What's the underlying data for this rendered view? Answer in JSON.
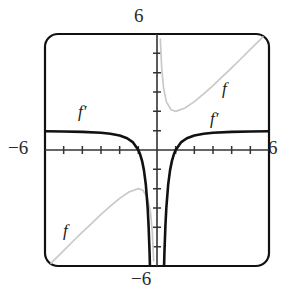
{
  "figure": {
    "title": "",
    "axis_labels": {
      "top": "6",
      "left": "−6",
      "right": "6",
      "bottom": "−6"
    },
    "curve_labels": {
      "f_upper": "f",
      "f_lower": "f",
      "fprime_left": "f′",
      "fprime_right": "f′"
    },
    "colors": {
      "f_curve": "#c9c9c9",
      "fprime_curve": "#111111",
      "axis": "#333333",
      "frame": "#111111",
      "background": "#ffffff"
    }
  },
  "chart_data": {
    "type": "line",
    "title": "",
    "xlabel": "",
    "ylabel": "",
    "xlim": [
      -6,
      6
    ],
    "ylim": [
      -6,
      6
    ],
    "grid": false,
    "legend": "inline-curve-labels",
    "xticks": [
      -5,
      -4,
      -3,
      -2,
      -1,
      1,
      2,
      3,
      4,
      5
    ],
    "yticks": [
      -5,
      -4,
      -3,
      -2,
      -1,
      1,
      2,
      3,
      4,
      5
    ],
    "xtick_labels": [
      "−6",
      "6"
    ],
    "ytick_labels": [
      "−6",
      "6"
    ],
    "annotations": [
      {
        "text": "f",
        "x": 4.0,
        "y": 3.1
      },
      {
        "text": "f",
        "x": -3.5,
        "y": -2.55
      },
      {
        "text": "f′",
        "x": -2.7,
        "y": 1.8
      },
      {
        "text": "f′",
        "x": 3.2,
        "y": 1.45
      }
    ],
    "series": [
      {
        "name": "f",
        "expression": "f(x) = x + 1/x",
        "color": "#c9c9c9",
        "style": "solid-light",
        "asymptotes": {
          "vertical": [
            0
          ],
          "oblique": [
            "y = x"
          ]
        },
        "local_max": {
          "x": -1,
          "y": -2
        },
        "local_min": {
          "x": 1,
          "y": 2
        },
        "branch_negative_x": [
          {
            "x": -6.0,
            "y": -6.17
          },
          {
            "x": -5.5,
            "y": -5.68
          },
          {
            "x": -5.0,
            "y": -5.2
          },
          {
            "x": -4.5,
            "y": -4.72
          },
          {
            "x": -4.0,
            "y": -4.25
          },
          {
            "x": -3.5,
            "y": -3.79
          },
          {
            "x": -3.0,
            "y": -3.33
          },
          {
            "x": -2.5,
            "y": -2.9
          },
          {
            "x": -2.0,
            "y": -2.5
          },
          {
            "x": -1.5,
            "y": -2.17
          },
          {
            "x": -1.0,
            "y": -2.0
          },
          {
            "x": -0.75,
            "y": -2.08
          },
          {
            "x": -0.5,
            "y": -2.5
          },
          {
            "x": -0.35,
            "y": -3.21
          },
          {
            "x": -0.25,
            "y": -4.25
          },
          {
            "x": -0.18,
            "y": -5.74
          }
        ],
        "branch_positive_x": [
          {
            "x": 0.18,
            "y": 5.74
          },
          {
            "x": 0.25,
            "y": 4.25
          },
          {
            "x": 0.35,
            "y": 3.21
          },
          {
            "x": 0.5,
            "y": 2.5
          },
          {
            "x": 0.75,
            "y": 2.08
          },
          {
            "x": 1.0,
            "y": 2.0
          },
          {
            "x": 1.5,
            "y": 2.17
          },
          {
            "x": 2.0,
            "y": 2.5
          },
          {
            "x": 2.5,
            "y": 2.9
          },
          {
            "x": 3.0,
            "y": 3.33
          },
          {
            "x": 3.5,
            "y": 3.79
          },
          {
            "x": 4.0,
            "y": 4.25
          },
          {
            "x": 4.5,
            "y": 4.72
          },
          {
            "x": 5.0,
            "y": 5.2
          },
          {
            "x": 5.5,
            "y": 5.68
          },
          {
            "x": 6.0,
            "y": 6.17
          }
        ]
      },
      {
        "name": "f'",
        "expression": "f′(x) = 1 − 1/x²",
        "color": "#111111",
        "style": "solid-bold",
        "asymptotes": {
          "vertical": [
            0
          ],
          "horizontal": [
            "y = 1"
          ]
        },
        "zeros": [
          -1,
          1
        ],
        "branch_negative_x": [
          {
            "x": -6.0,
            "y": 0.972
          },
          {
            "x": -5.0,
            "y": 0.96
          },
          {
            "x": -4.0,
            "y": 0.938
          },
          {
            "x": -3.0,
            "y": 0.889
          },
          {
            "x": -2.5,
            "y": 0.84
          },
          {
            "x": -2.0,
            "y": 0.75
          },
          {
            "x": -1.6,
            "y": 0.609
          },
          {
            "x": -1.3,
            "y": 0.408
          },
          {
            "x": -1.0,
            "y": 0.0
          },
          {
            "x": -0.9,
            "y": -0.235
          },
          {
            "x": -0.8,
            "y": -0.563
          },
          {
            "x": -0.7,
            "y": -1.041
          },
          {
            "x": -0.6,
            "y": -1.778
          },
          {
            "x": -0.5,
            "y": -3.0
          },
          {
            "x": -0.45,
            "y": -3.938
          },
          {
            "x": -0.4,
            "y": -5.25
          },
          {
            "x": -0.375,
            "y": -6.111
          }
        ],
        "branch_positive_x": [
          {
            "x": 0.375,
            "y": -6.111
          },
          {
            "x": 0.4,
            "y": -5.25
          },
          {
            "x": 0.45,
            "y": -3.938
          },
          {
            "x": 0.5,
            "y": -3.0
          },
          {
            "x": 0.6,
            "y": -1.778
          },
          {
            "x": 0.7,
            "y": -1.041
          },
          {
            "x": 0.8,
            "y": -0.563
          },
          {
            "x": 0.9,
            "y": -0.235
          },
          {
            "x": 1.0,
            "y": 0.0
          },
          {
            "x": 1.3,
            "y": 0.408
          },
          {
            "x": 1.6,
            "y": 0.609
          },
          {
            "x": 2.0,
            "y": 0.75
          },
          {
            "x": 2.5,
            "y": 0.84
          },
          {
            "x": 3.0,
            "y": 0.889
          },
          {
            "x": 4.0,
            "y": 0.938
          },
          {
            "x": 5.0,
            "y": 0.96
          },
          {
            "x": 6.0,
            "y": 0.972
          }
        ]
      }
    ]
  }
}
